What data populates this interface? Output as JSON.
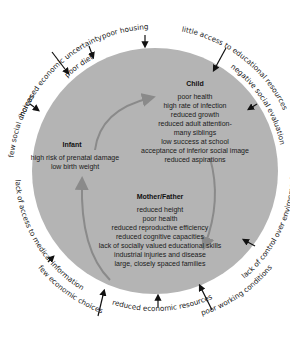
{
  "diagram": {
    "type": "cycle",
    "circle_color": "#b4b4b4",
    "cycle_arrow_color": "#8a8a8a",
    "groups": {
      "child": {
        "title": "Child",
        "items": [
          "poor health",
          "high rate of infection",
          "reduced growth",
          "reduced adult attention-",
          "many siblings",
          "low success at school",
          "acceptance of inferior social image",
          "reduced aspirations"
        ]
      },
      "infant": {
        "title": "Infant",
        "items": [
          "high risk of prenatal damage",
          "low birth weight"
        ]
      },
      "parent": {
        "title": "Mother/Father",
        "items": [
          "reduced height",
          "poor health",
          "reduced reproductive efficiency",
          "reduced cognitive capacities",
          "lack of socially valued educational skills",
          "industrial injuries and disease",
          "large, closely spaced families"
        ]
      }
    },
    "outer_factors": [
      "few social choices",
      "increased economic uncertainty",
      "poor diet",
      "poor housing",
      "little access to educational resources",
      "negative social evaluation",
      "lack of control over environment",
      "poor working conditions",
      "reduced economic resources",
      "few economic choices",
      "lack of access to medical information"
    ]
  }
}
